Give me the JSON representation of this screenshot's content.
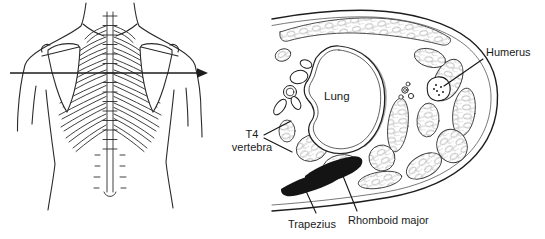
{
  "labels": {
    "lung": "Lung",
    "humerus": "Humerus",
    "t4_line1": "T4",
    "t4_line2": "vertebra",
    "trapezius": "Trapezius",
    "rhomboid_major": "Rhomboid major"
  },
  "colors": {
    "background": "#ffffff",
    "line": "#1d1d1d",
    "muscle_black": "#141414"
  }
}
